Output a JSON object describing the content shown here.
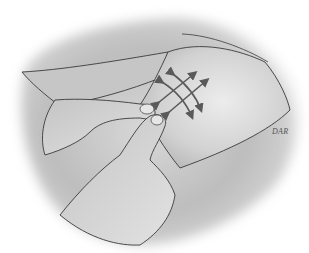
{
  "illustration": {
    "subject": "two hands pinching and lifting skin with multidirectional stretch arrows",
    "signature": "DAR",
    "arrows": {
      "count": 4,
      "style": "double-headed curved arrows in a crosshatch",
      "color": "#5a5a5a"
    },
    "colors": {
      "background": "#ffffff",
      "shading_dark": "#8a8a8a",
      "shading_mid": "#b8b8b8",
      "skin_light": "#dcdcdc",
      "outline": "#3a3a3a"
    }
  }
}
